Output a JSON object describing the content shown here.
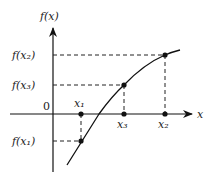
{
  "diagram": {
    "type": "function-graph",
    "labels": {
      "y_axis": "f(x)",
      "x_axis": "x",
      "origin": "0",
      "fx1": "f(x₁)",
      "fx2": "f(x₂)",
      "fx3": "f(x₃)",
      "x1": "x₁",
      "x2": "x₂",
      "x3": "x₃"
    },
    "points": [
      {
        "name": "x1",
        "x": 81,
        "y": 141
      },
      {
        "name": "x3",
        "x": 124,
        "y": 85
      },
      {
        "name": "x2",
        "x": 165,
        "y": 55
      }
    ],
    "colors": {
      "stroke": "#111111",
      "dash": "#222222"
    }
  }
}
